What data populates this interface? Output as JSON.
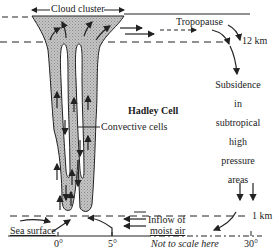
{
  "diagram": {
    "title": "Hadley Cell",
    "labels": {
      "cloud_cluster": "Cloud cluster",
      "tropopause": "Tropopause",
      "altitude_top": "12 km",
      "hadley_cell": "Hadley Cell",
      "convective_cells": "Convective cells",
      "subsidence_lines": [
        "Subsidence",
        "in",
        "subtropical",
        "high",
        "pressure",
        "areas"
      ],
      "altitude_bottom": "1 km",
      "inflow_line1": "Inflow of",
      "inflow_line2": "moist air",
      "sea_surface": "Sea surface",
      "not_to_scale": "Not to scale here"
    },
    "x_axis": {
      "ticks": [
        "0°",
        "5°",
        "30°"
      ]
    },
    "colors": {
      "cloud_fill": "#b8b8b8",
      "line": "#222222",
      "background": "#ffffff"
    }
  }
}
